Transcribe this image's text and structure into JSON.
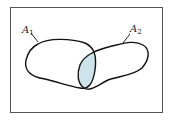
{
  "diagram": {
    "type": "venn",
    "sets": [
      {
        "id": "A1",
        "label_main": "A",
        "label_sub": "1"
      },
      {
        "id": "A2",
        "label_main": "A",
        "label_sub": "2"
      }
    ],
    "shaded_region": "intersection A1 ∩ A2",
    "colors": {
      "outline": "#111111",
      "intersection_fill": "#cfe3ea",
      "frame": "#555555",
      "background": "#ffffff"
    }
  }
}
